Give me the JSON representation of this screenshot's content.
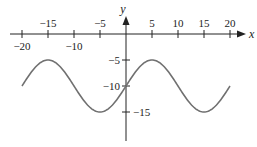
{
  "chart_data": {
    "type": "line",
    "title": "",
    "xlabel": "x",
    "ylabel": "y",
    "xlim": [
      -20,
      20
    ],
    "ylim": [
      -17,
      5
    ],
    "grid": false,
    "legend": null,
    "x_ticks": [
      -20,
      -15,
      -10,
      -5,
      5,
      10,
      15,
      20
    ],
    "x_tick_labels_above": [
      "-15",
      "-5",
      "5",
      "10",
      "15",
      "20"
    ],
    "x_tick_labels_below": [
      "-20",
      "-10"
    ],
    "y_ticks": [
      -5,
      -10,
      -15
    ],
    "series": [
      {
        "name": "curve",
        "formula": "y = -10 + 5 sin(pi*(x+20)/10)",
        "x": [
          -20,
          -15,
          -10,
          -5,
          0,
          5,
          10,
          15,
          20
        ],
        "y": [
          -10,
          -5,
          -10,
          -15,
          -10,
          -5,
          -10,
          -15,
          -10
        ],
        "color": "#707070"
      }
    ]
  },
  "labels": {
    "x_axis": "x",
    "y_axis": "y",
    "xt_m20": "−20",
    "xt_m15": "−15",
    "xt_m10": "−10",
    "xt_m5": "−5",
    "xt_5": "5",
    "xt_10": "10",
    "xt_15": "15",
    "xt_20": "20",
    "yt_m5": "−5",
    "yt_m10": "−10",
    "yt_m15": "−15"
  }
}
